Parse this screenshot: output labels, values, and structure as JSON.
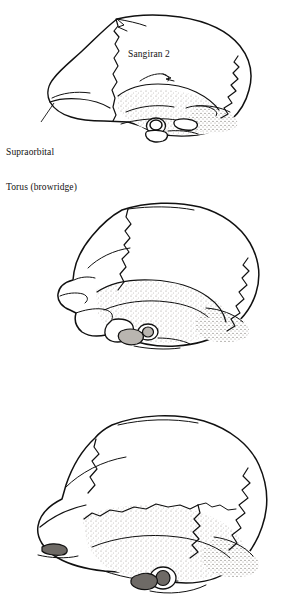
{
  "figure": {
    "type": "anatomical-line-drawing",
    "panel_count": 3,
    "background_color": "#ffffff",
    "ink_color": "#111111",
    "shading_color": "#b9b5b0",
    "dark_shading_color": "#6e6a66"
  },
  "panels": [
    {
      "index": 1,
      "position": "top",
      "specimen_label": "Sangiran 2",
      "annotated": true,
      "annotations": [
        {
          "name": "supraorbital-torus",
          "line_1": "Supraorbital",
          "line_2": "Torus (browridge)",
          "has_leader_line": true,
          "points_to": "browridge at front of cranium"
        }
      ]
    },
    {
      "index": 2,
      "position": "middle",
      "specimen_label": "",
      "annotated": false,
      "annotations": []
    },
    {
      "index": 3,
      "position": "bottom",
      "specimen_label": "",
      "annotated": false,
      "annotations": []
    }
  ],
  "labels": {
    "sangiran": "Sangiran 2",
    "torus_line_1": "Supraorbital",
    "torus_line_2": "Torus (browridge)"
  }
}
